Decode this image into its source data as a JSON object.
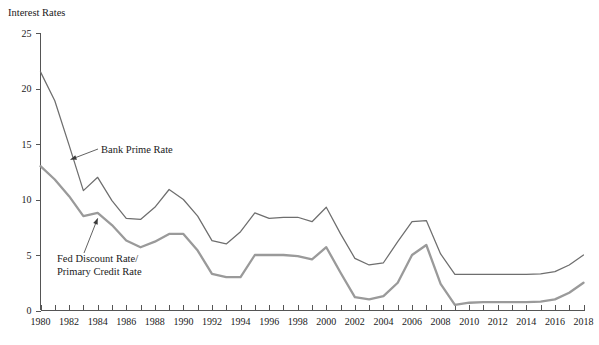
{
  "chart_data": {
    "type": "line",
    "title": "",
    "ylabel": "Interest Rates",
    "xlabel": "",
    "ylim": [
      0,
      25
    ],
    "xlim": [
      1980,
      2018
    ],
    "yticks": [
      0,
      5,
      10,
      15,
      20,
      25
    ],
    "ytick_labels": [
      "0",
      "5",
      "10",
      "15",
      "20",
      "25"
    ],
    "xticks": [
      1980,
      1982,
      1984,
      1986,
      1988,
      1990,
      1992,
      1994,
      1996,
      1998,
      2000,
      2002,
      2004,
      2006,
      2008,
      2010,
      2012,
      2014,
      2016,
      2018
    ],
    "xtick_labels": [
      "1980",
      "1982",
      "1984",
      "1986",
      "1988",
      "1990",
      "1992",
      "1994",
      "1996",
      "1998",
      "2000",
      "2002",
      "2004",
      "2006",
      "2008",
      "2010",
      "2012",
      "2014",
      "2016",
      "2018"
    ],
    "xtick_minor_step": 1,
    "grid": false,
    "legend_position": "inline-annotations",
    "x": [
      1980,
      1981,
      1982,
      1983,
      1984,
      1985,
      1986,
      1987,
      1988,
      1989,
      1990,
      1991,
      1992,
      1993,
      1994,
      1995,
      1996,
      1997,
      1998,
      1999,
      2000,
      2001,
      2002,
      2003,
      2004,
      2005,
      2006,
      2007,
      2008,
      2009,
      2010,
      2011,
      2012,
      2013,
      2014,
      2015,
      2016,
      2017,
      2018
    ],
    "series": [
      {
        "name": "Bank Prime Rate",
        "color": "#6e6e6e",
        "values": [
          21.5,
          18.9,
          14.9,
          10.8,
          12.0,
          9.9,
          8.3,
          8.2,
          9.3,
          10.9,
          10.0,
          8.5,
          6.3,
          6.0,
          7.1,
          8.8,
          8.3,
          8.4,
          8.4,
          8.0,
          9.3,
          6.9,
          4.7,
          4.1,
          4.3,
          6.2,
          8.0,
          8.1,
          5.1,
          3.25,
          3.25,
          3.25,
          3.25,
          3.25,
          3.25,
          3.3,
          3.5,
          4.1,
          5.0
        ],
        "label_annotation": "Bank Prime Rate"
      },
      {
        "name": "Fed Discount Rate/Primary Credit Rate",
        "color": "#9a9a9a",
        "values": [
          13.0,
          11.8,
          10.3,
          8.5,
          8.8,
          7.7,
          6.3,
          5.7,
          6.2,
          6.9,
          6.9,
          5.4,
          3.3,
          3.0,
          3.0,
          5.0,
          5.0,
          5.0,
          4.9,
          4.6,
          5.7,
          3.4,
          1.2,
          1.0,
          1.3,
          2.5,
          5.0,
          5.9,
          2.4,
          0.5,
          0.7,
          0.75,
          0.75,
          0.75,
          0.75,
          0.8,
          1.0,
          1.6,
          2.5
        ],
        "label_annotation": "Fed Discount Rate/\nPrimary Credit Rate"
      }
    ],
    "annotations": [
      {
        "name": "bank-prime-rate-annotation",
        "text": "Bank Prime Rate",
        "line1": "Bank Prime Rate",
        "line2": "",
        "points_to_year": 1982.1,
        "points_to_value": 13.6
      },
      {
        "name": "fed-discount-rate-annotation",
        "text": "Fed Discount Rate/ Primary Credit Rate",
        "line1": "Fed Discount Rate/",
        "line2": "Primary Credit Rate",
        "points_to_year": 1984.0,
        "points_to_value": 8.3
      }
    ]
  },
  "colors": {
    "background": "#ffffff",
    "axis": "#555555",
    "text": "#1a1a1a",
    "prime_series": "#6e6e6e",
    "discount_series": "#9a9a9a"
  }
}
